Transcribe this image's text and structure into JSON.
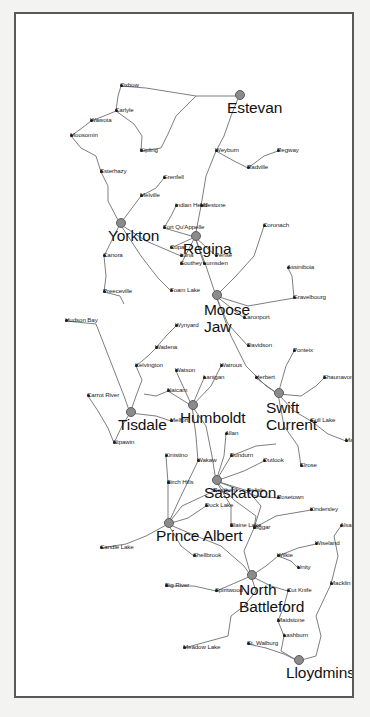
{
  "map": {
    "title": "Saskatchewan Road Map",
    "region": "Saskatchewan, Canada",
    "orientation": "rotated-90-ccw",
    "frame_color": "#58595b",
    "background_color": "#ffffff",
    "road_color": "#6f6f6f",
    "major_city_marker_color": "#8b8b8b",
    "town_marker_color": "#1a1a1a",
    "major_cities": [
      {
        "name": "Yorkton",
        "x": 472,
        "y": 104
      },
      {
        "name": "Estevan",
        "x": 600,
        "y": 223
      },
      {
        "name": "Tisdale",
        "x": 283,
        "y": 114
      },
      {
        "name": "Prince Albert",
        "x": 172,
        "y": 152
      },
      {
        "name": "Humboldt",
        "x": 290,
        "y": 176
      },
      {
        "name": "Regina",
        "x": 459,
        "y": 179
      },
      {
        "name": "Moose Jaw",
        "x": 400,
        "y": 200
      },
      {
        "name": "Saskatoon",
        "x": 215,
        "y": 200
      },
      {
        "name": "North Battleford",
        "x": 120,
        "y": 235
      },
      {
        "name": "Swift Current",
        "x": 302,
        "y": 262
      },
      {
        "name": "Lloydminster",
        "x": 35,
        "y": 282
      }
    ],
    "towns": [
      {
        "name": "Hudson Bay",
        "x": 375,
        "y": 50
      },
      {
        "name": "Carrot River",
        "x": 300,
        "y": 72
      },
      {
        "name": "Nipawin",
        "x": 253,
        "y": 98
      },
      {
        "name": "Preeceville",
        "x": 404,
        "y": 88
      },
      {
        "name": "Canora",
        "x": 440,
        "y": 88
      },
      {
        "name": "Esterhazy",
        "x": 524,
        "y": 85
      },
      {
        "name": "Moosomin",
        "x": 560,
        "y": 55
      },
      {
        "name": "Wawota",
        "x": 575,
        "y": 75
      },
      {
        "name": "Carlyle",
        "x": 585,
        "y": 100
      },
      {
        "name": "Oxbow",
        "x": 610,
        "y": 105
      },
      {
        "name": "Kipling",
        "x": 545,
        "y": 125
      },
      {
        "name": "Melville",
        "x": 500,
        "y": 125
      },
      {
        "name": "Grenfell",
        "x": 518,
        "y": 148
      },
      {
        "name": "Kelvington",
        "x": 330,
        "y": 120
      },
      {
        "name": "Wadena",
        "x": 348,
        "y": 140
      },
      {
        "name": "Melfort",
        "x": 275,
        "y": 155
      },
      {
        "name": "Naicam",
        "x": 305,
        "y": 152
      },
      {
        "name": "Watson",
        "x": 325,
        "y": 160
      },
      {
        "name": "Wynyard",
        "x": 370,
        "y": 160
      },
      {
        "name": "Foam Lake",
        "x": 405,
        "y": 155
      },
      {
        "name": "Ituna",
        "x": 440,
        "y": 165
      },
      {
        "name": "Fort Qu'Appelle",
        "x": 468,
        "y": 148
      },
      {
        "name": "Indian Head",
        "x": 490,
        "y": 160
      },
      {
        "name": "Candle Lake",
        "x": 148,
        "y": 85
      },
      {
        "name": "Birch Hills",
        "x": 213,
        "y": 152
      },
      {
        "name": "Kinistino",
        "x": 240,
        "y": 150
      },
      {
        "name": "Wakaw",
        "x": 235,
        "y": 182
      },
      {
        "name": "Lanigan",
        "x": 318,
        "y": 188
      },
      {
        "name": "Watrous",
        "x": 330,
        "y": 205
      },
      {
        "name": "Shellbrook",
        "x": 140,
        "y": 178
      },
      {
        "name": "Duck Lake",
        "x": 190,
        "y": 190
      },
      {
        "name": "Rosthern",
        "x": 205,
        "y": 198
      },
      {
        "name": "Blaine Lake",
        "x": 170,
        "y": 215
      },
      {
        "name": "Big River",
        "x": 110,
        "y": 150
      },
      {
        "name": "Spiritwood",
        "x": 105,
        "y": 200
      },
      {
        "name": "Meadow Lake",
        "x": 48,
        "y": 168
      },
      {
        "name": "St. Walburg",
        "x": 52,
        "y": 232
      },
      {
        "name": "Lashburn",
        "x": 60,
        "y": 268
      },
      {
        "name": "Maidstone",
        "x": 75,
        "y": 262
      },
      {
        "name": "Cut Knife",
        "x": 105,
        "y": 272
      },
      {
        "name": "Unity",
        "x": 128,
        "y": 282
      },
      {
        "name": "Wilkie",
        "x": 140,
        "y": 262
      },
      {
        "name": "Macklin",
        "x": 112,
        "y": 315
      },
      {
        "name": "Wiseland",
        "x": 152,
        "y": 300
      },
      {
        "name": "Kindersley",
        "x": 186,
        "y": 295
      },
      {
        "name": "Alsask",
        "x": 170,
        "y": 325
      },
      {
        "name": "Biggar",
        "x": 168,
        "y": 238
      },
      {
        "name": "Dundurn",
        "x": 240,
        "y": 215
      },
      {
        "name": "Allan",
        "x": 262,
        "y": 210
      },
      {
        "name": "Delisle",
        "x": 205,
        "y": 232
      },
      {
        "name": "Outlook",
        "x": 235,
        "y": 248
      },
      {
        "name": "Rosetown",
        "x": 198,
        "y": 262
      },
      {
        "name": "Elrose",
        "x": 230,
        "y": 285
      },
      {
        "name": "Davidson",
        "x": 350,
        "y": 232
      },
      {
        "name": "Caronport",
        "x": 378,
        "y": 228
      },
      {
        "name": "Lumsden",
        "x": 432,
        "y": 188
      },
      {
        "name": "Pense",
        "x": 440,
        "y": 200
      },
      {
        "name": "Southey",
        "x": 432,
        "y": 165
      },
      {
        "name": "Cupar",
        "x": 448,
        "y": 155
      },
      {
        "name": "Milestone",
        "x": 490,
        "y": 185
      },
      {
        "name": "Gravelbourg",
        "x": 398,
        "y": 278
      },
      {
        "name": "Assiniboia",
        "x": 428,
        "y": 272
      },
      {
        "name": "Coronach",
        "x": 470,
        "y": 248
      },
      {
        "name": "Weyburn",
        "x": 545,
        "y": 200
      },
      {
        "name": "Radville",
        "x": 528,
        "y": 232
      },
      {
        "name": "Regway",
        "x": 545,
        "y": 262
      },
      {
        "name": "Herbert",
        "x": 318,
        "y": 240
      },
      {
        "name": "Ponteix",
        "x": 345,
        "y": 278
      },
      {
        "name": "Shaunavon",
        "x": 318,
        "y": 308
      },
      {
        "name": "Gull Lake",
        "x": 275,
        "y": 295
      },
      {
        "name": "Maple Creek",
        "x": 255,
        "y": 330
      }
    ]
  }
}
